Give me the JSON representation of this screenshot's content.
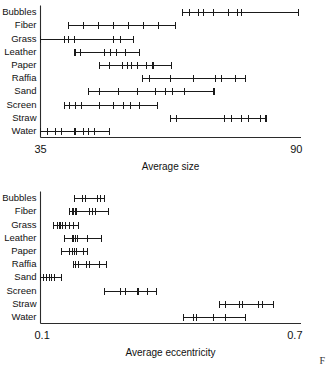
{
  "figure": {
    "corner_mark": "F"
  },
  "chart_data": [
    {
      "type": "scatter",
      "name": "average-size-panel",
      "title": "",
      "xlabel": "Average size",
      "ylabel": "",
      "xlim": [
        35,
        90
      ],
      "xtick_labels": [
        "35",
        "90"
      ],
      "grid": false,
      "legend": "none",
      "orientation": "horizontal",
      "categories": [
        "Bubbles",
        "Fiber",
        "Grass",
        "Leather",
        "Paper",
        "Raffia",
        "Sand",
        "Screen",
        "Straw",
        "Water"
      ],
      "rows": [
        {
          "category": "Bubbles",
          "min": 65.1,
          "max": 89.6,
          "ticks": [
            66.6,
            68.5,
            69.5,
            71.5,
            74.8,
            76.6,
            77.6
          ]
        },
        {
          "category": "Fiber",
          "min": 40.9,
          "max": 63.6,
          "ticks": [
            44.1,
            47.3,
            50.4,
            53.6,
            56.8,
            60.0
          ]
        },
        {
          "category": "Grass",
          "min": 35.0,
          "max": 54.6,
          "ticks": [
            40.0,
            41.0,
            42.1,
            50.4,
            51.9
          ]
        },
        {
          "category": "Leather",
          "min": 42.3,
          "max": 55.9,
          "ticks": [
            43.4,
            48.6,
            49.8,
            51.0,
            53.0
          ]
        },
        {
          "category": "Paper",
          "min": 47.5,
          "max": 62.8,
          "ticks": [
            49.6,
            52.3,
            53.4,
            54.3,
            55.5,
            57.5,
            58.8
          ]
        },
        {
          "category": "Raffia",
          "min": 56.5,
          "max": 78.3,
          "ticks": [
            58.0,
            62.5,
            67.3,
            72.0,
            73.3,
            76.2
          ]
        },
        {
          "category": "Sand",
          "min": 45.1,
          "max": 71.7,
          "ticks": [
            47.5,
            51.5,
            55.5,
            59.4,
            61.5,
            63.0,
            65.4
          ]
        },
        {
          "category": "Screen",
          "min": 40.0,
          "max": 59.7,
          "ticks": [
            41.1,
            42.5,
            43.6,
            47.5,
            50.5,
            52.5,
            54.0,
            56.0
          ]
        },
        {
          "category": "Straw",
          "min": 62.6,
          "max": 82.7,
          "ticks": [
            63.8,
            74.0,
            75.5,
            77.6,
            79.0,
            81.5
          ]
        },
        {
          "category": "Water",
          "min": 35.0,
          "max": 49.5,
          "ticks": [
            36.5,
            38.2,
            39.4,
            42.3,
            44.0,
            45.2,
            46.4
          ]
        }
      ]
    },
    {
      "type": "scatter",
      "name": "average-eccentricity-panel",
      "title": "",
      "xlabel": "Average eccentricity",
      "ylabel": "",
      "xlim": [
        0.1,
        0.7
      ],
      "xtick_labels": [
        "0.1",
        "0.7"
      ],
      "grid": false,
      "legend": "none",
      "orientation": "horizontal",
      "categories": [
        "Bubbles",
        "Fiber",
        "Grass",
        "Leather",
        "Paper",
        "Raffia",
        "Sand",
        "Screen",
        "Straw",
        "Water"
      ],
      "rows": [
        {
          "category": "Bubbles",
          "min": 0.178,
          "max": 0.248,
          "ticks": [
            0.196,
            0.204,
            0.232,
            0.239
          ]
        },
        {
          "category": "Fiber",
          "min": 0.166,
          "max": 0.256,
          "ticks": [
            0.175,
            0.18,
            0.184,
            0.212,
            0.22,
            0.227
          ]
        },
        {
          "category": "Grass",
          "min": 0.131,
          "max": 0.187,
          "ticks": [
            0.139,
            0.145,
            0.151,
            0.157,
            0.168,
            0.176
          ]
        },
        {
          "category": "Leather",
          "min": 0.155,
          "max": 0.241,
          "ticks": [
            0.175,
            0.18,
            0.185,
            0.209
          ]
        },
        {
          "category": "Paper",
          "min": 0.149,
          "max": 0.208,
          "ticks": [
            0.168,
            0.173,
            0.178,
            0.182,
            0.199
          ]
        },
        {
          "category": "Raffia",
          "min": 0.176,
          "max": 0.253,
          "ticks": [
            0.181,
            0.188,
            0.206,
            0.213,
            0.236
          ]
        },
        {
          "category": "Sand",
          "min": 0.1,
          "max": 0.148,
          "ticks": [
            0.108,
            0.114,
            0.12,
            0.126,
            0.132
          ]
        },
        {
          "category": "Screen",
          "min": 0.248,
          "max": 0.367,
          "ticks": [
            0.285,
            0.296,
            0.325,
            0.348
          ]
        },
        {
          "category": "Straw",
          "min": 0.513,
          "max": 0.637,
          "ticks": [
            0.527,
            0.56,
            0.566,
            0.603,
            0.612
          ]
        },
        {
          "category": "Water",
          "min": 0.43,
          "max": 0.572,
          "ticks": [
            0.452,
            0.46,
            0.5,
            0.528
          ]
        }
      ]
    }
  ]
}
